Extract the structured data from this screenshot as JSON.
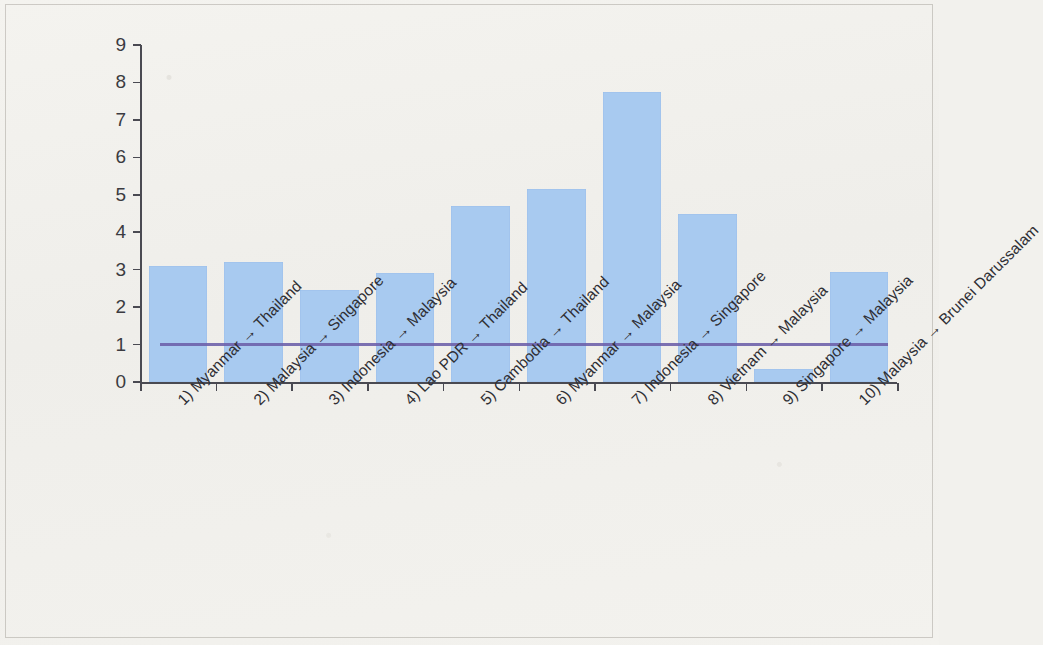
{
  "chart_data": {
    "type": "bar",
    "title": "",
    "subtitle": "",
    "xlabel": "",
    "ylabel": "",
    "ylim": [
      0,
      9
    ],
    "yticks": [
      0,
      1,
      2,
      3,
      4,
      5,
      6,
      7,
      8,
      9
    ],
    "ytick_labels": [
      "0",
      "1",
      "2",
      "3",
      "4",
      "5",
      "6",
      "7",
      "8",
      "9"
    ],
    "grid": false,
    "legend": false,
    "bar_color": "#a8caf0",
    "axis_color": "#4a4a52",
    "categories": [
      "1) Myanmar → Thailand",
      "2) Malaysia → Singapore",
      "3) Indonesia → Malaysia",
      "4) Lao PDR → Thailand",
      "5) Cambodia → Thailand",
      "6) Myanmar → Malaysia",
      "7) Indonesia → Singapore",
      "8) Vietnam → Malaysia",
      "9) Singapore → Malaysia",
      "10) Malaysia → Brunei Darussalam"
    ],
    "values": [
      3.1,
      3.2,
      2.45,
      2.9,
      4.7,
      5.15,
      7.75,
      4.5,
      0.35,
      2.95
    ],
    "reference_line": {
      "label": "",
      "value": 1.0,
      "color": "#6b5fa8",
      "orientation": "horizontal"
    }
  }
}
